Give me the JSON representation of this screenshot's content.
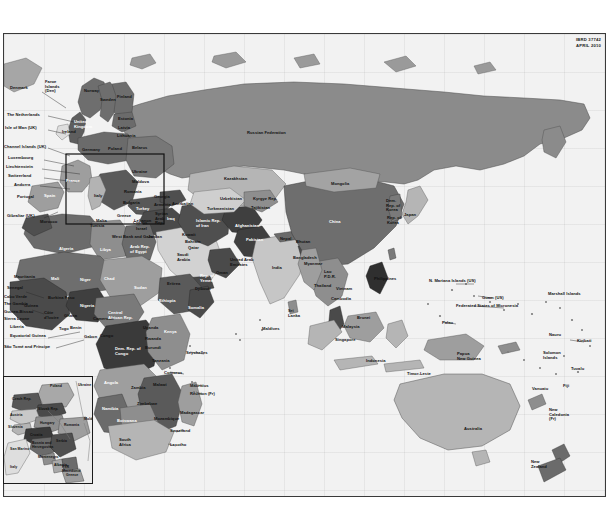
{
  "document": {
    "type": "world-map",
    "publisher_code": "IBRD 37742",
    "date": "APRIL 2010",
    "projection_note": "Eastern Hemisphere world map: Europe, Africa, Asia, Oceania"
  },
  "credit": {
    "line1": "IBRD 37742",
    "line2": "APRIL 2010"
  },
  "colors": {
    "page_background": "#ffffff",
    "ocean": "#f2f2f2",
    "frame_border": "#3a3a3a",
    "shade_darkest": "#3f3f3f",
    "shade_dark": "#585858",
    "shade_mid": "#7d7d7d",
    "shade_light": "#a6a6a6",
    "shade_lighter": "#c4c4c4",
    "shade_lightest": "#dedede",
    "label_text": "#111111",
    "label_text_light": "#ffffff",
    "inset_border": "#1c1c1c"
  },
  "inset": {
    "title": "Central and Eastern Europe inset",
    "labels": [
      "Poland",
      "Czech Rep.",
      "Slovak Rep.",
      "Austria",
      "Hungary",
      "Slovenia",
      "Croatia",
      "Romania",
      "Bosnia and Herzegovina",
      "Serbia",
      "San Marino",
      "Montenegro",
      "Albania",
      "FYR Macedonia",
      "Italy",
      "Greece",
      "Ukraine",
      "Moldova"
    ]
  },
  "labels": {
    "europe_west": [
      {
        "text": "Denmark",
        "x": 6,
        "y": 52,
        "tone": "dark"
      },
      {
        "text": "Faroe\nIslands\n(Den)",
        "x": 41,
        "y": 46,
        "tone": "dark"
      },
      {
        "text": "The Netherlands",
        "x": 3,
        "y": 79,
        "tone": "dark"
      },
      {
        "text": "Isle of Man (UK)",
        "x": 1,
        "y": 92,
        "tone": "dark"
      },
      {
        "text": "Channel Islands (UK)",
        "x": 0,
        "y": 111,
        "tone": "dark"
      },
      {
        "text": "Luxembourg",
        "x": 4,
        "y": 122,
        "tone": "dark"
      },
      {
        "text": "Liechtenstein",
        "x": 2,
        "y": 131,
        "tone": "dark"
      },
      {
        "text": "Switzerland",
        "x": 4,
        "y": 140,
        "tone": "dark"
      },
      {
        "text": "Andorra",
        "x": 10,
        "y": 149,
        "tone": "dark"
      },
      {
        "text": "Portugal",
        "x": 13,
        "y": 161,
        "tone": "dark"
      },
      {
        "text": "Gibraltar (UK)",
        "x": 3,
        "y": 180,
        "tone": "dark"
      },
      {
        "text": "Ireland",
        "x": 58,
        "y": 96,
        "tone": "dark"
      },
      {
        "text": "United\nKingdom",
        "x": 70,
        "y": 86,
        "tone": "light"
      },
      {
        "text": "France",
        "x": 62,
        "y": 145,
        "tone": "light"
      },
      {
        "text": "Spain",
        "x": 40,
        "y": 160,
        "tone": "light"
      },
      {
        "text": "Morocco",
        "x": 36,
        "y": 186,
        "tone": "dark"
      }
    ],
    "europe_north_east": [
      {
        "text": "Norway",
        "x": 80,
        "y": 55,
        "tone": "dark"
      },
      {
        "text": "Sweden",
        "x": 96,
        "y": 64,
        "tone": "dark"
      },
      {
        "text": "Finland",
        "x": 113,
        "y": 61,
        "tone": "dark"
      },
      {
        "text": "Estonia",
        "x": 114,
        "y": 83,
        "tone": "dark"
      },
      {
        "text": "Latvia",
        "x": 114,
        "y": 92,
        "tone": "dark"
      },
      {
        "text": "Lithuania",
        "x": 113,
        "y": 100,
        "tone": "dark"
      },
      {
        "text": "Germany",
        "x": 78,
        "y": 114,
        "tone": "dark"
      },
      {
        "text": "Poland",
        "x": 104,
        "y": 113,
        "tone": "dark"
      },
      {
        "text": "Belarus",
        "x": 128,
        "y": 112,
        "tone": "dark"
      },
      {
        "text": "Ukraine",
        "x": 128,
        "y": 136,
        "tone": "dark"
      },
      {
        "text": "Moldova",
        "x": 128,
        "y": 146,
        "tone": "dark"
      },
      {
        "text": "Romania",
        "x": 120,
        "y": 156,
        "tone": "dark"
      },
      {
        "text": "Bulgaria",
        "x": 119,
        "y": 167,
        "tone": "dark"
      },
      {
        "text": "Italy",
        "x": 90,
        "y": 160,
        "tone": "dark"
      },
      {
        "text": "Greece",
        "x": 113,
        "y": 180,
        "tone": "dark"
      },
      {
        "text": "Malta",
        "x": 92,
        "y": 185,
        "tone": "dark"
      },
      {
        "text": "Turkey",
        "x": 132,
        "y": 173,
        "tone": "light"
      },
      {
        "text": "Cyprus",
        "x": 129,
        "y": 187,
        "tone": "dark"
      },
      {
        "text": "Russian Federation",
        "x": 243,
        "y": 97,
        "tone": "dark"
      }
    ],
    "middle_east": [
      {
        "text": "Georgia",
        "x": 150,
        "y": 161,
        "tone": "dark"
      },
      {
        "text": "Armenia",
        "x": 150,
        "y": 169,
        "tone": "dark"
      },
      {
        "text": "Azerbaijan",
        "x": 168,
        "y": 168,
        "tone": "dark"
      },
      {
        "text": "Lebanon",
        "x": 130,
        "y": 185,
        "tone": "dark"
      },
      {
        "text": "Israel",
        "x": 132,
        "y": 193,
        "tone": "dark"
      },
      {
        "text": "West Bank and Gaza",
        "x": 108,
        "y": 201,
        "tone": "dark"
      },
      {
        "text": "Jordan",
        "x": 144,
        "y": 201,
        "tone": "dark"
      },
      {
        "text": "Syrian\nArab\nRep.",
        "x": 151,
        "y": 178,
        "tone": "dark"
      },
      {
        "text": "Iraq",
        "x": 163,
        "y": 183,
        "tone": "light"
      },
      {
        "text": "Arab Rep.\nof Egypt",
        "x": 126,
        "y": 211,
        "tone": "light"
      },
      {
        "text": "Saudi\nArabia",
        "x": 173,
        "y": 219,
        "tone": "dark"
      },
      {
        "text": "Kuwait",
        "x": 178,
        "y": 199,
        "tone": "dark"
      },
      {
        "text": "Bahrain",
        "x": 181,
        "y": 206,
        "tone": "dark"
      },
      {
        "text": "Qatar",
        "x": 184,
        "y": 212,
        "tone": "dark"
      },
      {
        "text": "United Arab\nEmirates",
        "x": 226,
        "y": 224,
        "tone": "dark"
      },
      {
        "text": "Oman",
        "x": 212,
        "y": 237,
        "tone": "dark"
      },
      {
        "text": "Rep. of\nYemen",
        "x": 196,
        "y": 240,
        "tone": "light"
      },
      {
        "text": "Djibouti",
        "x": 191,
        "y": 253,
        "tone": "dark"
      },
      {
        "text": "Islamic Rep.\nof Iran",
        "x": 192,
        "y": 185,
        "tone": "light"
      }
    ],
    "central_asia": [
      {
        "text": "Kazakhstan",
        "x": 220,
        "y": 143,
        "tone": "dark"
      },
      {
        "text": "Uzbekistan",
        "x": 216,
        "y": 163,
        "tone": "dark"
      },
      {
        "text": "Turkmenistan",
        "x": 203,
        "y": 173,
        "tone": "dark"
      },
      {
        "text": "Kyrgyz Rep.",
        "x": 249,
        "y": 163,
        "tone": "dark"
      },
      {
        "text": "Tajikistan",
        "x": 247,
        "y": 172,
        "tone": "dark"
      },
      {
        "text": "Afghanistan",
        "x": 231,
        "y": 190,
        "tone": "light"
      },
      {
        "text": "Pakistan",
        "x": 242,
        "y": 204,
        "tone": "light"
      },
      {
        "text": "India",
        "x": 268,
        "y": 232,
        "tone": "dark"
      },
      {
        "text": "Nepal",
        "x": 276,
        "y": 203,
        "tone": "dark"
      },
      {
        "text": "Bhutan",
        "x": 292,
        "y": 206,
        "tone": "dark"
      },
      {
        "text": "Bangladesh",
        "x": 289,
        "y": 222,
        "tone": "dark"
      },
      {
        "text": "Sri\nLanka",
        "x": 284,
        "y": 275,
        "tone": "dark"
      },
      {
        "text": "Maldives",
        "x": 258,
        "y": 293,
        "tone": "dark"
      }
    ],
    "east_asia": [
      {
        "text": "Mongolia",
        "x": 327,
        "y": 148,
        "tone": "dark"
      },
      {
        "text": "China",
        "x": 325,
        "y": 186,
        "tone": "light"
      },
      {
        "text": "Dem.\nRep. of\nKorea",
        "x": 382,
        "y": 165,
        "tone": "dark"
      },
      {
        "text": "Rep. of\nKorea",
        "x": 383,
        "y": 182,
        "tone": "dark"
      },
      {
        "text": "Japan",
        "x": 400,
        "y": 179,
        "tone": "dark"
      },
      {
        "text": "Myanmar",
        "x": 300,
        "y": 228,
        "tone": "dark"
      },
      {
        "text": "Lao\nP.D.R.",
        "x": 320,
        "y": 236,
        "tone": "dark"
      },
      {
        "text": "Thailand",
        "x": 310,
        "y": 250,
        "tone": "dark"
      },
      {
        "text": "Vietnam",
        "x": 332,
        "y": 253,
        "tone": "dark"
      },
      {
        "text": "Cambodia",
        "x": 327,
        "y": 263,
        "tone": "dark"
      },
      {
        "text": "Philippines",
        "x": 370,
        "y": 243,
        "tone": "dark"
      },
      {
        "text": "Brunei",
        "x": 353,
        "y": 282,
        "tone": "dark"
      },
      {
        "text": "Malaysia",
        "x": 338,
        "y": 291,
        "tone": "dark"
      },
      {
        "text": "Singapore",
        "x": 331,
        "y": 304,
        "tone": "dark"
      },
      {
        "text": "Indonesia",
        "x": 362,
        "y": 325,
        "tone": "dark"
      },
      {
        "text": "Timor-Leste",
        "x": 403,
        "y": 338,
        "tone": "dark"
      }
    ],
    "africa": [
      {
        "text": "Algeria",
        "x": 55,
        "y": 213,
        "tone": "light"
      },
      {
        "text": "Libya",
        "x": 96,
        "y": 214,
        "tone": "light"
      },
      {
        "text": "Tunisia",
        "x": 86,
        "y": 190,
        "tone": "dark"
      },
      {
        "text": "Mauritania",
        "x": 10,
        "y": 241,
        "tone": "dark"
      },
      {
        "text": "Mali",
        "x": 47,
        "y": 243,
        "tone": "light"
      },
      {
        "text": "Niger",
        "x": 76,
        "y": 244,
        "tone": "light"
      },
      {
        "text": "Chad",
        "x": 100,
        "y": 243,
        "tone": "light"
      },
      {
        "text": "Sudan",
        "x": 130,
        "y": 252,
        "tone": "light"
      },
      {
        "text": "Eritrea",
        "x": 163,
        "y": 248,
        "tone": "dark"
      },
      {
        "text": "Ethiopia",
        "x": 155,
        "y": 265,
        "tone": "light"
      },
      {
        "text": "Somalia",
        "x": 184,
        "y": 272,
        "tone": "light"
      },
      {
        "text": "Cabo Verde",
        "x": 0,
        "y": 261,
        "tone": "dark"
      },
      {
        "text": "Senegal",
        "x": 3,
        "y": 252,
        "tone": "dark"
      },
      {
        "text": "The Gambia",
        "x": 0,
        "y": 268,
        "tone": "dark"
      },
      {
        "text": "Guinea-Bissau",
        "x": 0,
        "y": 276,
        "tone": "dark"
      },
      {
        "text": "Guinea",
        "x": 20,
        "y": 270,
        "tone": "dark"
      },
      {
        "text": "Sierra Leone",
        "x": 0,
        "y": 283,
        "tone": "dark"
      },
      {
        "text": "Liberia",
        "x": 6,
        "y": 291,
        "tone": "dark"
      },
      {
        "text": "Côte\nd'Ivoire",
        "x": 40,
        "y": 277,
        "tone": "dark"
      },
      {
        "text": "Ghana",
        "x": 60,
        "y": 280,
        "tone": "dark"
      },
      {
        "text": "Burkina Faso",
        "x": 44,
        "y": 262,
        "tone": "dark"
      },
      {
        "text": "Togo",
        "x": 55,
        "y": 293,
        "tone": "dark"
      },
      {
        "text": "Benin",
        "x": 66,
        "y": 292,
        "tone": "dark"
      },
      {
        "text": "Nigeria",
        "x": 76,
        "y": 270,
        "tone": "light"
      },
      {
        "text": "Equatorial Guinea",
        "x": 6,
        "y": 300,
        "tone": "dark"
      },
      {
        "text": "São Tomé and Príncipe",
        "x": 0,
        "y": 311,
        "tone": "dark"
      },
      {
        "text": "Cameroon",
        "x": 89,
        "y": 283,
        "tone": "dark"
      },
      {
        "text": "Central\nAfrican Rep.",
        "x": 104,
        "y": 277,
        "tone": "light"
      },
      {
        "text": "Gabon",
        "x": 80,
        "y": 301,
        "tone": "dark"
      },
      {
        "text": "Congo",
        "x": 96,
        "y": 300,
        "tone": "dark"
      },
      {
        "text": "Dem. Rep. of\nCongo",
        "x": 111,
        "y": 313,
        "tone": "light"
      },
      {
        "text": "Uganda",
        "x": 139,
        "y": 292,
        "tone": "dark"
      },
      {
        "text": "Rwanda",
        "x": 141,
        "y": 303,
        "tone": "dark"
      },
      {
        "text": "Burundi",
        "x": 141,
        "y": 312,
        "tone": "dark"
      },
      {
        "text": "Kenya",
        "x": 160,
        "y": 296,
        "tone": "light"
      },
      {
        "text": "Tanzania",
        "x": 148,
        "y": 325,
        "tone": "dark"
      },
      {
        "text": "Seychelles",
        "x": 182,
        "y": 317,
        "tone": "dark"
      },
      {
        "text": "Comoros",
        "x": 160,
        "y": 337,
        "tone": "dark"
      },
      {
        "text": "Angola",
        "x": 100,
        "y": 347,
        "tone": "light"
      },
      {
        "text": "Zambia",
        "x": 127,
        "y": 352,
        "tone": "dark"
      },
      {
        "text": "Malawi",
        "x": 149,
        "y": 349,
        "tone": "dark"
      },
      {
        "text": "Namibia",
        "x": 98,
        "y": 373,
        "tone": "light"
      },
      {
        "text": "Zimbabwe",
        "x": 133,
        "y": 368,
        "tone": "dark"
      },
      {
        "text": "Botswana",
        "x": 113,
        "y": 385,
        "tone": "light"
      },
      {
        "text": "Mozambique",
        "x": 150,
        "y": 383,
        "tone": "dark"
      },
      {
        "text": "Swaziland",
        "x": 166,
        "y": 395,
        "tone": "dark"
      },
      {
        "text": "South\nAfrica",
        "x": 115,
        "y": 404,
        "tone": "dark"
      },
      {
        "text": "Lesotho",
        "x": 166,
        "y": 409,
        "tone": "dark"
      },
      {
        "text": "Madagascar",
        "x": 176,
        "y": 377,
        "tone": "dark"
      },
      {
        "text": "Mauritius",
        "x": 186,
        "y": 350,
        "tone": "dark"
      },
      {
        "text": "Réunion (Fr)",
        "x": 186,
        "y": 358,
        "tone": "dark"
      }
    ],
    "pacific": [
      {
        "text": "N. Mariana Islands (US)",
        "x": 425,
        "y": 245,
        "tone": "dark"
      },
      {
        "text": "Guam (US)",
        "x": 478,
        "y": 262,
        "tone": "dark"
      },
      {
        "text": "Federated States of Micronesia",
        "x": 452,
        "y": 270,
        "tone": "dark"
      },
      {
        "text": "Marshall Islands",
        "x": 544,
        "y": 258,
        "tone": "dark"
      },
      {
        "text": "Palau",
        "x": 438,
        "y": 287,
        "tone": "dark"
      },
      {
        "text": "Nauru",
        "x": 545,
        "y": 299,
        "tone": "dark"
      },
      {
        "text": "Kiribati",
        "x": 573,
        "y": 305,
        "tone": "dark"
      },
      {
        "text": "Papua\nNew Guinea",
        "x": 453,
        "y": 318,
        "tone": "dark"
      },
      {
        "text": "Solomon\nIslands",
        "x": 539,
        "y": 317,
        "tone": "dark"
      },
      {
        "text": "Tuvalu",
        "x": 567,
        "y": 333,
        "tone": "dark"
      },
      {
        "text": "Vanuatu",
        "x": 528,
        "y": 353,
        "tone": "dark"
      },
      {
        "text": "Fiji",
        "x": 559,
        "y": 350,
        "tone": "dark"
      },
      {
        "text": "New\nCaledonia\n(Fr)",
        "x": 545,
        "y": 374,
        "tone": "dark"
      },
      {
        "text": "Australia",
        "x": 460,
        "y": 393,
        "tone": "dark"
      },
      {
        "text": "New\nZealand",
        "x": 527,
        "y": 426,
        "tone": "dark"
      }
    ]
  }
}
